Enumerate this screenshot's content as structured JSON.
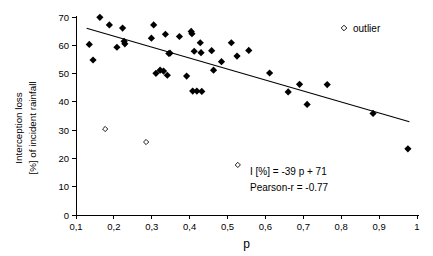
{
  "chart_data": {
    "type": "scatter",
    "title": "",
    "xlabel": "p",
    "ylabel_line1": "Interception loss",
    "ylabel_line2": "[%] of incident rainfall",
    "xlim": [
      0.1,
      1.0
    ],
    "ylim": [
      0,
      70
    ],
    "xticks": [
      0.1,
      0.2,
      0.3,
      0.4,
      0.5,
      0.6,
      0.7,
      0.8,
      0.9,
      1.0
    ],
    "xtick_labels": [
      "0,1",
      "0,2",
      "0,3",
      "0,4",
      "0,5",
      "0,6",
      "0,7",
      "0,8",
      "0,9",
      "1"
    ],
    "yticks": [
      0,
      10,
      20,
      30,
      40,
      50,
      60,
      70
    ],
    "ytick_labels": [
      "0",
      "10",
      "20",
      "30",
      "40",
      "50",
      "60",
      "70"
    ],
    "grid": false,
    "legend_position": "top-right",
    "legend": [
      {
        "label": "outlier",
        "marker": "open-diamond"
      }
    ],
    "annotations": [
      {
        "name": "regression-equation",
        "text": "I [%] = -39 p + 71"
      },
      {
        "name": "pearson-r",
        "text": "Pearson-r = -0.77"
      }
    ],
    "trendline": {
      "name": "regression-line",
      "equation": "I [%] = -39 p + 71",
      "slope": -39,
      "intercept": 71,
      "pearson_r": -0.77,
      "x_start": 0.128,
      "y_start": 66.0,
      "x_end": 0.98,
      "y_end": 33.0
    },
    "series": [
      {
        "name": "data",
        "marker": "filled-diamond",
        "color": "#000000",
        "points": [
          [
            0.135,
            60.3
          ],
          [
            0.145,
            54.8
          ],
          [
            0.163,
            69.9
          ],
          [
            0.188,
            67.2
          ],
          [
            0.208,
            59.3
          ],
          [
            0.223,
            66.1
          ],
          [
            0.227,
            61.4
          ],
          [
            0.229,
            60.5
          ],
          [
            0.299,
            62.5
          ],
          [
            0.305,
            67.2
          ],
          [
            0.311,
            50.1
          ],
          [
            0.322,
            51.2
          ],
          [
            0.331,
            50.9
          ],
          [
            0.336,
            63.9
          ],
          [
            0.341,
            49.4
          ],
          [
            0.345,
            57.1
          ],
          [
            0.348,
            57.2
          ],
          [
            0.373,
            63.1
          ],
          [
            0.392,
            49.1
          ],
          [
            0.404,
            64.9
          ],
          [
            0.406,
            64.1
          ],
          [
            0.408,
            43.8
          ],
          [
            0.412,
            57.9
          ],
          [
            0.419,
            43.8
          ],
          [
            0.428,
            60.9
          ],
          [
            0.43,
            57.4
          ],
          [
            0.432,
            43.7
          ],
          [
            0.458,
            58.1
          ],
          [
            0.463,
            51.2
          ],
          [
            0.484,
            54.2
          ],
          [
            0.51,
            60.9
          ],
          [
            0.525,
            56.2
          ],
          [
            0.556,
            58.2
          ],
          [
            0.611,
            50.2
          ],
          [
            0.66,
            43.5
          ],
          [
            0.69,
            46.2
          ],
          [
            0.71,
            39.1
          ],
          [
            0.763,
            46.1
          ],
          [
            0.884,
            35.9
          ],
          [
            0.976,
            23.4
          ]
        ]
      },
      {
        "name": "outlier",
        "marker": "open-diamond",
        "color": "#000000",
        "points": [
          [
            0.177,
            30.4
          ],
          [
            0.285,
            25.8
          ],
          [
            0.527,
            17.7
          ]
        ]
      }
    ]
  },
  "axes_geometry": {
    "left_px": 76,
    "right_px": 417,
    "top_px": 17,
    "bottom_px": 215
  }
}
